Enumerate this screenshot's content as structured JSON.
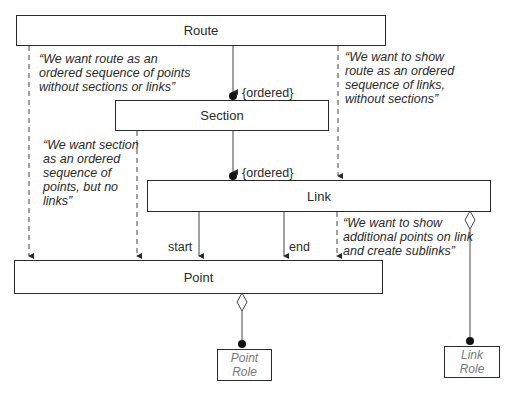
{
  "diagram": {
    "classes": {
      "route": "Route",
      "section": "Section",
      "link": "Link",
      "point": "Point",
      "point_role": [
        "Point",
        "Role"
      ],
      "link_role": [
        "Link",
        "Role"
      ]
    },
    "constraints": {
      "route_section": "{ordered}",
      "section_link": "{ordered}"
    },
    "role_labels": {
      "start": "start",
      "end": "end"
    },
    "notes": {
      "route_points": "“We want route as an\nordered sequence of points\nwithout sections or links”",
      "route_links": "“We want to show\nroute as an ordered\nsequence of links,\nwithout sections”",
      "section_points": "“We want section\nas an ordered\nsequence of\npoints, but no\nlinks”",
      "link_points": "“We want to show\nadditional points on link\nand create sublinks”"
    },
    "colors": {
      "line": "#2a2a2a",
      "role_text": "#777777"
    }
  }
}
